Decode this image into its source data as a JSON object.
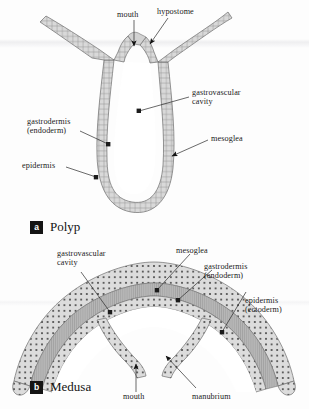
{
  "figure": {
    "background_color": "#fdfdfd",
    "ink_color": "#1b1b1b"
  },
  "colors": {
    "tissue_fill": "#d7d7d7",
    "tissue_stroke": "#6f6f6f",
    "mesoglea_fill": "#b9b9b9",
    "cavity_fill": "#ffffff",
    "cell_line": "#8d8d8d",
    "nucleus_dot": "#3a3a3a",
    "leader_line": "#2a2a2a",
    "tag_background": "#141414",
    "tag_text": "#ffffff"
  },
  "panels": [
    {
      "id": "polyp",
      "tag": "a",
      "name": "Polyp",
      "labels": [
        {
          "id": "mouth",
          "text": "mouth",
          "lines": [
            "mouth"
          ]
        },
        {
          "id": "hypostome",
          "text": "hypostome",
          "lines": [
            "hypostome"
          ]
        },
        {
          "id": "gastrovascular-cavity",
          "text": "gastrovascular cavity",
          "lines": [
            "gastrovascular",
            "cavity"
          ]
        },
        {
          "id": "mesoglea",
          "text": "mesoglea",
          "lines": [
            "mesoglea"
          ]
        },
        {
          "id": "gastrodermis",
          "text": "gastrodermis (endoderm)",
          "lines": [
            "gastrodermis",
            "(endoderm)"
          ]
        },
        {
          "id": "epidermis",
          "text": "epidermis",
          "lines": [
            "epidermis"
          ]
        }
      ]
    },
    {
      "id": "medusa",
      "tag": "b",
      "name": "Medusa",
      "labels": [
        {
          "id": "gastrovascular-cavity",
          "text": "gastrovascular cavity",
          "lines": [
            "gastrovascular",
            "cavity"
          ]
        },
        {
          "id": "mesoglea",
          "text": "mesoglea",
          "lines": [
            "mesoglea"
          ]
        },
        {
          "id": "gastrodermis",
          "text": "gastrodermis (endoderm)",
          "lines": [
            "gastrodermis",
            "(endoderm)"
          ]
        },
        {
          "id": "epidermis",
          "text": "epidermis (ectoderm)",
          "lines": [
            "epidermis",
            "(ectoderm)"
          ]
        },
        {
          "id": "mouth",
          "text": "mouth",
          "lines": [
            "mouth"
          ]
        },
        {
          "id": "manubrium",
          "text": "manubrium",
          "lines": [
            "manubrium"
          ]
        }
      ]
    }
  ],
  "text": {
    "polyp": {
      "mouth": "mouth",
      "hypostome": "hypostome",
      "gvc_l1": "gastrovascular",
      "gvc_l2": "cavity",
      "mesoglea": "mesoglea",
      "gastrodermis_l1": "gastrodermis",
      "gastrodermis_l2": "(endoderm)",
      "epidermis": "epidermis",
      "tag": "a",
      "name": "Polyp"
    },
    "medusa": {
      "gvc_l1": "gastrovascular",
      "gvc_l2": "cavity",
      "mesoglea": "mesoglea",
      "gastrodermis_l1": "gastrodermis",
      "gastrodermis_l2": "(endoderm)",
      "epidermis_l1": "epidermis",
      "epidermis_l2": "(ectoderm)",
      "mouth": "mouth",
      "manubrium": "manubrium",
      "tag": "b",
      "name": "Medusa"
    }
  }
}
